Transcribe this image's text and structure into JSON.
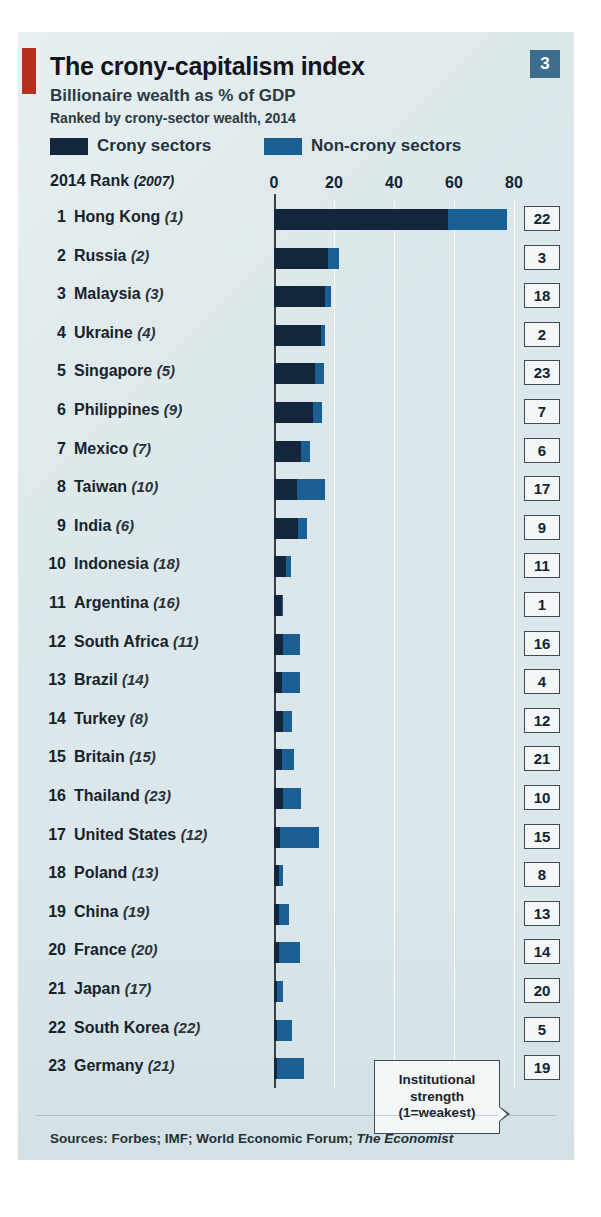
{
  "figure": {
    "badge_number": "3",
    "title": "The crony-capitalism index",
    "subtitle": "Billionaire wealth as % of GDP",
    "subtitle2": "Ranked by crony-sector wealth, 2014",
    "rank_header_bold": "2014 Rank",
    "rank_header_italic": "(2007)",
    "sources_label": "Sources: Forbes; IMF; World Economic Forum;",
    "sources_italic": "The Economist",
    "callout_line1": "Institutional",
    "callout_line2": "strength",
    "callout_line3": "(1=weakest)"
  },
  "legend": [
    {
      "label": "Crony sectors",
      "color": "#14263c",
      "key": "crony"
    },
    {
      "label": "Non-crony sectors",
      "color": "#1a5f93",
      "key": "noncrony"
    }
  ],
  "colors": {
    "crony": "#14263c",
    "noncrony": "#1a5f93",
    "panel_background": "#dbe7ea",
    "accent_red": "#b5301a",
    "badge_blue": "#3c6d8c",
    "text": "#17232c",
    "gridline": "#ffffff",
    "axis": "#3a3f44"
  },
  "chart_data": {
    "type": "bar",
    "orientation": "horizontal",
    "stacked": true,
    "title": "The crony-capitalism index",
    "subtitle": "Billionaire wealth as % of GDP",
    "note": "Ranked by crony-sector wealth, 2014",
    "xlabel": "Billionaire wealth as % of GDP",
    "ylabel": "",
    "xlim": [
      0,
      80
    ],
    "xticks": [
      0,
      20,
      40,
      60,
      80
    ],
    "xtick_labels": [
      "0",
      "20",
      "40",
      "60",
      "80"
    ],
    "grid": true,
    "legend_position": "top",
    "series": [
      {
        "name": "Crony sectors",
        "color": "#14263c",
        "values": [
          58.0,
          18.0,
          17.0,
          15.5,
          13.5,
          13.0,
          9.0,
          7.5,
          8.0,
          4.0,
          2.5,
          3.0,
          2.5,
          3.0,
          2.5,
          3.0,
          2.0,
          1.5,
          1.5,
          1.5,
          1.0,
          1.0,
          1.0
        ]
      },
      {
        "name": "Non-crony sectors",
        "color": "#1a5f93",
        "values": [
          19.5,
          3.5,
          2.0,
          1.5,
          3.0,
          3.0,
          3.0,
          9.5,
          3.0,
          1.5,
          0.5,
          5.5,
          6.0,
          3.0,
          4.0,
          6.0,
          13.0,
          1.5,
          3.5,
          7.0,
          2.0,
          5.0,
          9.0
        ]
      }
    ],
    "categories": [
      "Hong Kong",
      "Russia",
      "Malaysia",
      "Ukraine",
      "Singapore",
      "Philippines",
      "Mexico",
      "Taiwan",
      "India",
      "Indonesia",
      "Argentina",
      "South Africa",
      "Brazil",
      "Turkey",
      "Britain",
      "Thailand",
      "United States",
      "Poland",
      "China",
      "France",
      "Japan",
      "South Korea",
      "Germany"
    ],
    "rows": [
      {
        "rank": "1",
        "country": "Hong Kong",
        "rank_2007": "(1)",
        "crony": 58.0,
        "noncrony": 19.5,
        "total": 77.5,
        "institutional_strength": "22"
      },
      {
        "rank": "2",
        "country": "Russia",
        "rank_2007": "(2)",
        "crony": 18.0,
        "noncrony": 3.5,
        "total": 21.5,
        "institutional_strength": "3"
      },
      {
        "rank": "3",
        "country": "Malaysia",
        "rank_2007": "(3)",
        "crony": 17.0,
        "noncrony": 2.0,
        "total": 19.0,
        "institutional_strength": "18"
      },
      {
        "rank": "4",
        "country": "Ukraine",
        "rank_2007": "(4)",
        "crony": 15.5,
        "noncrony": 1.5,
        "total": 17.0,
        "institutional_strength": "2"
      },
      {
        "rank": "5",
        "country": "Singapore",
        "rank_2007": "(5)",
        "crony": 13.5,
        "noncrony": 3.0,
        "total": 16.5,
        "institutional_strength": "23"
      },
      {
        "rank": "6",
        "country": "Philippines",
        "rank_2007": "(9)",
        "crony": 13.0,
        "noncrony": 3.0,
        "total": 16.0,
        "institutional_strength": "7"
      },
      {
        "rank": "7",
        "country": "Mexico",
        "rank_2007": "(7)",
        "crony": 9.0,
        "noncrony": 3.0,
        "total": 12.0,
        "institutional_strength": "6"
      },
      {
        "rank": "8",
        "country": "Taiwan",
        "rank_2007": "(10)",
        "crony": 7.5,
        "noncrony": 9.5,
        "total": 17.0,
        "institutional_strength": "17"
      },
      {
        "rank": "9",
        "country": "India",
        "rank_2007": "(6)",
        "crony": 8.0,
        "noncrony": 3.0,
        "total": 11.0,
        "institutional_strength": "9"
      },
      {
        "rank": "10",
        "country": "Indonesia",
        "rank_2007": "(18)",
        "crony": 4.0,
        "noncrony": 1.5,
        "total": 5.5,
        "institutional_strength": "11"
      },
      {
        "rank": "11",
        "country": "Argentina",
        "rank_2007": "(16)",
        "crony": 2.5,
        "noncrony": 0.5,
        "total": 3.0,
        "institutional_strength": "1"
      },
      {
        "rank": "12",
        "country": "South Africa",
        "rank_2007": "(11)",
        "crony": 3.0,
        "noncrony": 5.5,
        "total": 8.5,
        "institutional_strength": "16"
      },
      {
        "rank": "13",
        "country": "Brazil",
        "rank_2007": "(14)",
        "crony": 2.5,
        "noncrony": 6.0,
        "total": 8.5,
        "institutional_strength": "4"
      },
      {
        "rank": "14",
        "country": "Turkey",
        "rank_2007": "(8)",
        "crony": 3.0,
        "noncrony": 3.0,
        "total": 6.0,
        "institutional_strength": "12"
      },
      {
        "rank": "15",
        "country": "Britain",
        "rank_2007": "(15)",
        "crony": 2.5,
        "noncrony": 4.0,
        "total": 6.5,
        "institutional_strength": "21"
      },
      {
        "rank": "16",
        "country": "Thailand",
        "rank_2007": "(23)",
        "crony": 3.0,
        "noncrony": 6.0,
        "total": 9.0,
        "institutional_strength": "10"
      },
      {
        "rank": "17",
        "country": "United States",
        "rank_2007": "(12)",
        "crony": 2.0,
        "noncrony": 13.0,
        "total": 15.0,
        "institutional_strength": "15"
      },
      {
        "rank": "18",
        "country": "Poland",
        "rank_2007": "(13)",
        "crony": 1.5,
        "noncrony": 1.5,
        "total": 3.0,
        "institutional_strength": "8"
      },
      {
        "rank": "19",
        "country": "China",
        "rank_2007": "(19)",
        "crony": 1.5,
        "noncrony": 3.5,
        "total": 5.0,
        "institutional_strength": "13"
      },
      {
        "rank": "20",
        "country": "France",
        "rank_2007": "(20)",
        "crony": 1.5,
        "noncrony": 7.0,
        "total": 8.5,
        "institutional_strength": "14"
      },
      {
        "rank": "21",
        "country": "Japan",
        "rank_2007": "(17)",
        "crony": 1.0,
        "noncrony": 2.0,
        "total": 3.0,
        "institutional_strength": "20"
      },
      {
        "rank": "22",
        "country": "South Korea",
        "rank_2007": "(22)",
        "crony": 1.0,
        "noncrony": 5.0,
        "total": 6.0,
        "institutional_strength": "5"
      },
      {
        "rank": "23",
        "country": "Germany",
        "rank_2007": "(21)",
        "crony": 1.0,
        "noncrony": 9.0,
        "total": 10.0,
        "institutional_strength": "19"
      }
    ]
  }
}
